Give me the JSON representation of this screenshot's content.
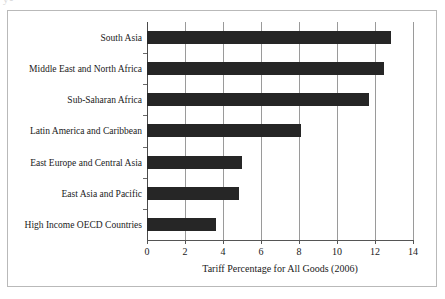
{
  "page_fragment": "y-",
  "chart_data": {
    "type": "bar",
    "orientation": "horizontal",
    "title": "",
    "xlabel": "Tariff Percentage for All Goods (2006)",
    "ylabel": "",
    "categories": [
      "South Asia",
      "Middle East and North Africa",
      "Sub-Saharan Africa",
      "Latin America and Caribbean",
      "East Europe and Central Asia",
      "East Asia and Pacific",
      "High Income OECD Countries"
    ],
    "values": [
      12.85,
      12.45,
      11.7,
      8.1,
      5.0,
      4.85,
      3.65
    ],
    "xlim": [
      0,
      14
    ],
    "xticks": [
      0,
      2,
      4,
      6,
      8,
      10,
      12,
      14
    ],
    "xtick_labels": [
      "0",
      "2",
      "4",
      "6",
      "8",
      "10",
      "12",
      "14"
    ],
    "grid": true,
    "grid_axis": "x",
    "legend": false,
    "bar_color": "#262626",
    "gridline_color": "#9a9a9a",
    "axis_color": "#555555",
    "background_color": "#ffffff",
    "border_color": "#b9b9b9"
  }
}
